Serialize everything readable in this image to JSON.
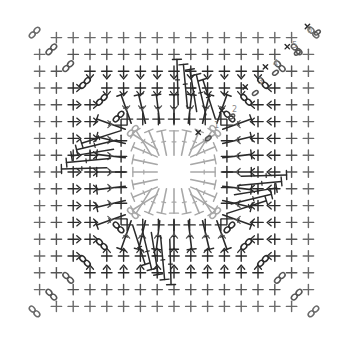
{
  "diagram": {
    "type": "crochet-chart",
    "shape": "square",
    "center": [
      174,
      172
    ],
    "grid_spacing": 16.8,
    "outer_extent": 9,
    "rounds": [
      {
        "number": "1",
        "color": "#a8a8a8",
        "label_pos": [
          214,
          128
        ]
      },
      {
        "number": "2",
        "color": "#404040",
        "label_pos": [
          232,
          112
        ]
      },
      {
        "number": "3",
        "color": "#505050",
        "label_pos": [
          258,
          84
        ]
      },
      {
        "number": "4",
        "color": "#404040",
        "label_pos": [
          273,
          66
        ]
      },
      {
        "number": "5",
        "color": "#404040",
        "label_pos": [
          292,
          48
        ]
      },
      {
        "number": "6",
        "color": "#606060",
        "label_pos": [
          307,
          33
        ]
      }
    ],
    "symbols": {
      "single_crochet": "plus",
      "double_crochet": "long-stitch-with-bar",
      "chain": "oval",
      "corner_chain_space": "figure-eight",
      "slip_stitch": "x-mark"
    },
    "colors": {
      "inner_round": "#a8a8a8",
      "dark_stitch": "#2a2a2a",
      "mid_stitch": "#555555",
      "outer_stitch": "#6a6a6a",
      "label": "#8a8a8a",
      "background": "#ffffff"
    }
  }
}
